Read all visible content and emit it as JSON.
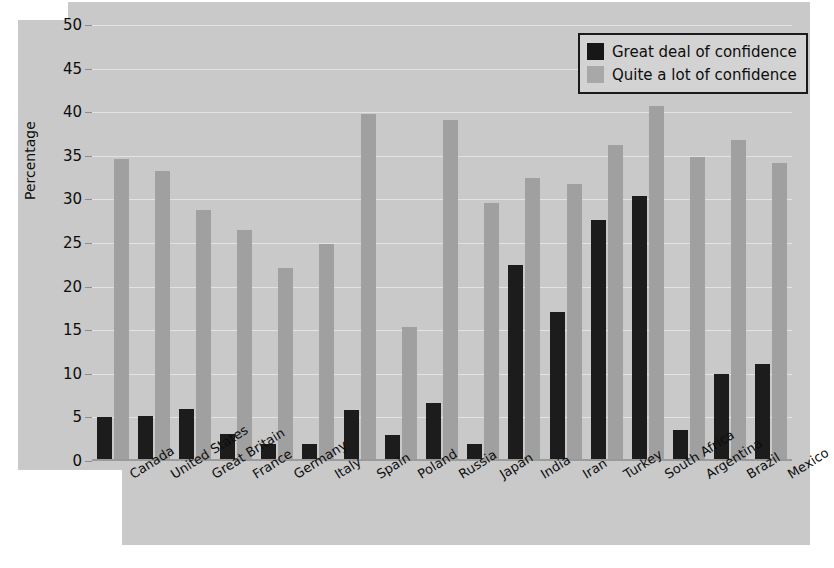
{
  "chart_data": {
    "type": "bar",
    "title": "",
    "xlabel": "",
    "ylabel": "Percentage",
    "ylim": [
      0,
      50
    ],
    "yticks": [
      0,
      5,
      10,
      15,
      20,
      25,
      30,
      35,
      40,
      45,
      50
    ],
    "grid": true,
    "legend_position": "top-right",
    "categories": [
      "Canada",
      "United States",
      "Great Britain",
      "France",
      "Germany",
      "Italy",
      "Spain",
      "Poland",
      "Russia",
      "Japan",
      "India",
      "Iran",
      "Turkey",
      "South Africa",
      "Argentina",
      "Brazil",
      "Mexico"
    ],
    "series": [
      {
        "name": "Great deal of confidence",
        "color": "#1c1c1c",
        "values": [
          5.0,
          5.2,
          6.0,
          3.1,
          2.0,
          2.0,
          5.8,
          3.0,
          6.6,
          2.0,
          22.5,
          17.1,
          27.6,
          30.4,
          3.5,
          10.0,
          11.1
        ]
      },
      {
        "name": "Quite a lot of confidence",
        "color": "#a0a0a0",
        "values": [
          34.6,
          33.3,
          28.8,
          26.5,
          22.1,
          24.9,
          39.8,
          15.4,
          39.1,
          29.6,
          32.4,
          31.8,
          36.2,
          40.7,
          34.9,
          36.8,
          34.2
        ]
      }
    ]
  },
  "legend": {
    "entries": [
      {
        "label": "Great deal of confidence",
        "swatch": "dark"
      },
      {
        "label": "Quite a lot of confidence",
        "swatch": "light"
      }
    ]
  },
  "axis": {
    "y_title": "Percentage"
  }
}
